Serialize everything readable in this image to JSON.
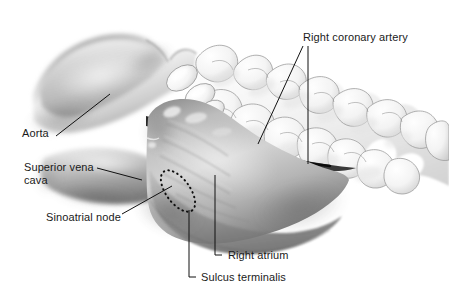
{
  "figure": {
    "background_color": "#ffffff",
    "label_color": "#1a1a1a",
    "leader_color": "#111111"
  },
  "labels": {
    "right_coronary_artery": "Right coronary artery",
    "aorta": "Aorta",
    "superior_vena_cava_line1": "Superior vena",
    "superior_vena_cava_line2": "cava",
    "sinoatrial_node": "Sinoatrial node",
    "right_atrium": "Right atrium",
    "sulcus_terminalis": "Sulcus terminalis"
  },
  "structures": {
    "aorta": "aorta",
    "superior_vena_cava": "superior-vena-cava",
    "right_atrium": "right-atrium",
    "sinoatrial_node": "sinoatrial-node",
    "coronary_sulcus": "coronary-sulcus",
    "epicardial_fat": "epicardial-fat"
  },
  "palette": {
    "atrium_light": "#d7d7d7",
    "atrium_mid": "#a8a8a8",
    "atrium_dark": "#6e6e6e",
    "aorta_light": "#efefef",
    "aorta_mid": "#b9b9b9",
    "aorta_dark": "#8a8a8a",
    "fat_light": "#fbfbfb",
    "fat_mid": "#e4e4e4",
    "fat_outline": "#8e8e8e",
    "sulcus_black": "#141414"
  }
}
